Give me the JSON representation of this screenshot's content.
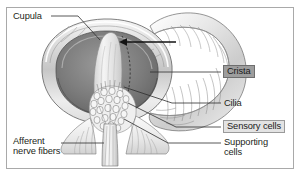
{
  "figure": {
    "kind": "anatomical-illustration",
    "border_color": "#a9a9a9",
    "background": "#ffffff"
  },
  "labels": [
    {
      "id": "cupula",
      "text": "Cupula",
      "style": "plain",
      "x": 13,
      "y": 13
    },
    {
      "id": "crista",
      "text": "Crista",
      "style": "boxed-dark",
      "x": 223,
      "y": 67
    },
    {
      "id": "cilia",
      "text": "Cilia",
      "style": "plain",
      "x": 224,
      "y": 100
    },
    {
      "id": "sensory-cells",
      "text": "Sensory cells",
      "style": "boxed-light",
      "x": 223,
      "y": 121
    },
    {
      "id": "supporting-cells",
      "text": "Supporting\ncells",
      "style": "plain",
      "x": 224,
      "y": 139
    },
    {
      "id": "afferent-nerve-fibers",
      "text": "Afferent\nnerve fibers",
      "style": "plain",
      "x": 13,
      "y": 138
    }
  ],
  "colors": {
    "outline": "#4a4a4a",
    "leader_line": "#3a3a3a",
    "arrow": "#1a1a1a",
    "canal_light": "#f2f2f2",
    "canal_mid": "#cfcfcf",
    "canal_dark": "#8e8e8e",
    "lumen_dark": "#707070",
    "lumen_darker": "#5a5a5a",
    "crista_fill": "#e8e8e8",
    "cupula_fill": "#efefef",
    "highlight_dark_box": "#9d9d9d",
    "highlight_light_box": "#e3e3e3"
  },
  "leaders": [
    {
      "id": "cupula-leader",
      "from": [
        52,
        17
      ],
      "to": [
        96,
        44
      ]
    },
    {
      "id": "crista-arrow",
      "from": [
        172,
        42
      ],
      "to": [
        120,
        42
      ]
    },
    {
      "id": "crista-leader",
      "from": [
        221,
        72
      ],
      "to": [
        150,
        72
      ]
    },
    {
      "id": "cilia-leader",
      "from": [
        221,
        103
      ],
      "to": [
        122,
        88
      ]
    },
    {
      "id": "sensory-leader",
      "from": [
        221,
        127
      ],
      "to": [
        128,
        104
      ]
    },
    {
      "id": "supporting-leader",
      "from": [
        221,
        143
      ],
      "to": [
        122,
        120
      ]
    },
    {
      "id": "afferent-leader",
      "from": [
        62,
        143
      ],
      "to": [
        100,
        143
      ]
    }
  ],
  "caption_partial": ""
}
